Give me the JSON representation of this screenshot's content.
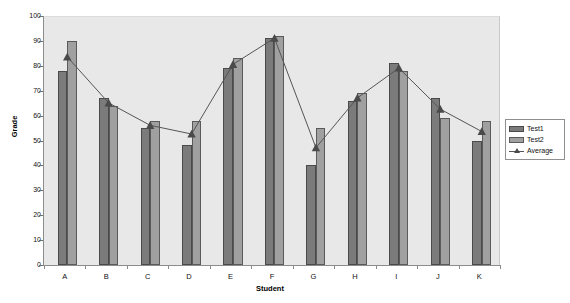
{
  "chart_data": {
    "type": "bar",
    "title": "",
    "xlabel": "Student",
    "ylabel": "Grade",
    "categories": [
      "A",
      "B",
      "C",
      "D",
      "E",
      "F",
      "G",
      "H",
      "I",
      "J",
      "K"
    ],
    "ylim": [
      0,
      100
    ],
    "ytick_step": 10,
    "yticks": [
      0,
      10,
      20,
      30,
      40,
      50,
      60,
      70,
      80,
      90,
      100
    ],
    "grid": false,
    "legend_position": "right",
    "series": [
      {
        "name": "Test1",
        "kind": "bar",
        "color": "#7b7b7b",
        "values": [
          78,
          67,
          55,
          48,
          79,
          91,
          40,
          66,
          81,
          67,
          50
        ]
      },
      {
        "name": "Test2",
        "kind": "bar",
        "color": "#a0a0a0",
        "values": [
          90,
          64,
          58,
          58,
          83,
          92,
          55,
          69,
          78,
          59,
          58
        ]
      },
      {
        "name": "Average",
        "kind": "line",
        "color": "#555555",
        "marker": "triangle",
        "values": [
          84,
          65.5,
          56.5,
          53,
          81,
          91.5,
          47.5,
          67.5,
          79.5,
          63,
          54
        ]
      }
    ]
  },
  "legend": {
    "items": [
      {
        "label": "Test1"
      },
      {
        "label": "Test2"
      },
      {
        "label": "Average"
      }
    ]
  }
}
